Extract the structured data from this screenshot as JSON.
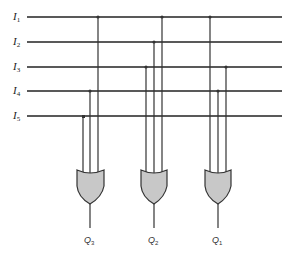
{
  "diagram": {
    "type": "OR-gate encoder",
    "inputs": [
      {
        "name": "I",
        "sub": "1",
        "y": 17
      },
      {
        "name": "I",
        "sub": "2",
        "y": 42
      },
      {
        "name": "I",
        "sub": "3",
        "y": 67
      },
      {
        "name": "I",
        "sub": "4",
        "y": 91
      },
      {
        "name": "I",
        "sub": "5",
        "y": 116
      }
    ],
    "gates": [
      {
        "output": "Q",
        "sub": "3",
        "connects": [
          "I1",
          "I4",
          "I5"
        ]
      },
      {
        "output": "Q",
        "sub": "2",
        "connects": [
          "I1",
          "I2",
          "I3"
        ]
      },
      {
        "output": "Q",
        "sub": "1",
        "connects": [
          "I1",
          "I3",
          "I4"
        ]
      }
    ],
    "colors": {
      "line": "#222222",
      "gate_fill": "#c8c8c8",
      "gate_stroke": "#333333"
    }
  }
}
